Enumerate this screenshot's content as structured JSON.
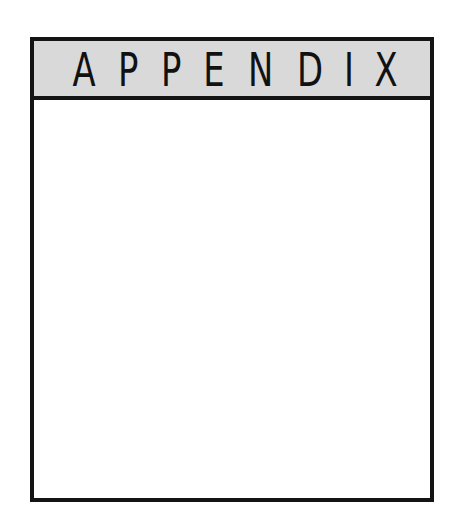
{
  "page": {
    "header": {
      "title": "APPENDIX",
      "letters": [
        "A",
        "P",
        "P",
        "E",
        "N",
        "D",
        "I",
        "X"
      ]
    },
    "body": {
      "content": ""
    },
    "colors": {
      "border": "#141414",
      "header_background": "#d9d9d9",
      "body_background": "#ffffff",
      "text": "#111111"
    }
  }
}
